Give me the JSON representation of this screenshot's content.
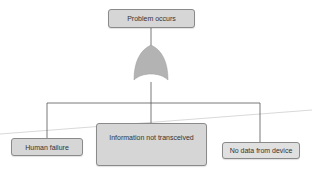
{
  "diagram": {
    "type": "fault-tree",
    "top_event": {
      "label": "Problem occurs"
    },
    "gate": {
      "type": "OR",
      "icon": "or-gate-icon",
      "color": "#b3b3b3"
    },
    "causes": [
      {
        "label": "Human failure"
      },
      {
        "label": "Information not transceived"
      },
      {
        "label": "No data from device"
      }
    ],
    "colors": {
      "node_fill": "#d6d6d6",
      "node_border": "#8a8a8a",
      "connector": "#555555",
      "background": "#ffffff"
    }
  }
}
